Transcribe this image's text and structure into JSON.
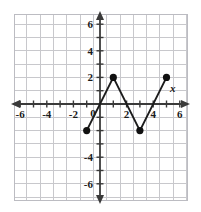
{
  "chart_data": {
    "type": "line",
    "title": "",
    "xlabel": "x",
    "ylabel": "",
    "xlim": [
      -7,
      7
    ],
    "ylim": [
      -7,
      7
    ],
    "grid": true,
    "grid_step": 1,
    "legend": "none",
    "x_tick_labels": [
      "-6",
      "-4",
      "-2",
      "0",
      "2",
      "4",
      "6"
    ],
    "x_tick_values": [
      -6,
      -4,
      -2,
      0,
      2,
      4,
      6
    ],
    "y_tick_labels": [
      "6",
      "4",
      "2",
      "-4",
      "-6"
    ],
    "y_tick_values": [
      6,
      4,
      2,
      -4,
      -6
    ],
    "series": [
      {
        "name": "zigzag",
        "marker": "filled-circle",
        "x": [
          -1,
          1,
          3,
          5
        ],
        "y": [
          -2,
          2,
          -2,
          2
        ],
        "points": [
          {
            "x": -1,
            "y": -2
          },
          {
            "x": 1,
            "y": 2
          },
          {
            "x": 3,
            "y": -2
          },
          {
            "x": 5,
            "y": 2
          }
        ]
      }
    ],
    "colors": {
      "line": "#1c1c1c",
      "marker": "#111111",
      "axis": "#3a3a3a",
      "grid": "#c8c8cc",
      "background": "#ffffff"
    }
  },
  "axis_labels": {
    "x_axis_name": "x"
  }
}
